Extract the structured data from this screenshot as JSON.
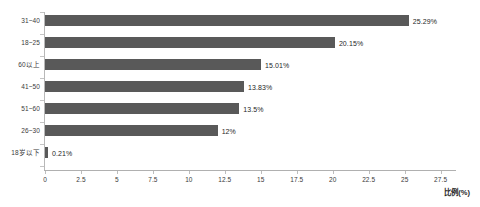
{
  "chart_data": {
    "type": "bar",
    "orientation": "horizontal",
    "title": "",
    "xlabel": "比例(%)",
    "ylabel": "",
    "categories": [
      "31~40",
      "18~25",
      "60以上",
      "41~50",
      "51~60",
      "26~30",
      "18岁以下"
    ],
    "values": [
      25.29,
      20.15,
      15.01,
      13.83,
      13.5,
      12,
      0.21
    ],
    "data_labels": [
      "25.29%",
      "20.15%",
      "15.01%",
      "13.83%",
      "13.5%",
      "12%",
      "0.21%"
    ],
    "xlim": [
      0,
      28.5
    ],
    "xticks": [
      0,
      2.5,
      5,
      7.5,
      10,
      12.5,
      15,
      17.5,
      20,
      22.5,
      25,
      27.5
    ],
    "xtick_labels": [
      "0",
      "2.5",
      "5",
      "7.5",
      "10",
      "12.5",
      "15",
      "17.5",
      "20",
      "22.5",
      "25",
      "27.5"
    ],
    "grid": false,
    "legend": false,
    "bar_color": "#595959",
    "axis_color": "#b8b8b8",
    "text_color": "#262626"
  }
}
